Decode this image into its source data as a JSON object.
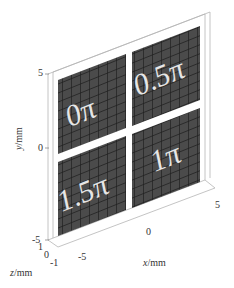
{
  "figure": {
    "type": "3d-plot-phase-plates",
    "plates": [
      {
        "label": "0π",
        "position": "top-left"
      },
      {
        "label": "0.5π",
        "position": "top-right"
      },
      {
        "label": "1.5π",
        "position": "bottom-left"
      },
      {
        "label": "1π",
        "position": "bottom-right"
      }
    ],
    "axes": {
      "y": {
        "label": "y",
        "unit": "/mm",
        "ticks": [
          "5",
          "0",
          "-5"
        ]
      },
      "z": {
        "label": "z",
        "unit": "/mm",
        "ticks": [
          "1",
          "0",
          "-1"
        ]
      },
      "x": {
        "label": "x",
        "unit": "/mm",
        "ticks": [
          "-5",
          "0",
          "5"
        ]
      }
    },
    "colors": {
      "plate": "#4a4a4a",
      "grid": "#1e1e1e",
      "plate_text": "#e8e8e8",
      "box": "#b8b8b8"
    }
  }
}
